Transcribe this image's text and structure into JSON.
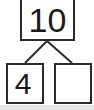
{
  "diagram": {
    "type": "number-bond",
    "line_color": "#2b2b2b",
    "border_color": "#2b2b2b",
    "text_color": "#1a1a1a",
    "background_color": "#ffffff",
    "strip_color": "#e9e9e9",
    "total": {
      "label": "10",
      "value": 10,
      "filled": true
    },
    "parts": [
      {
        "label": "4",
        "value": 4,
        "filled": true
      },
      {
        "label": "",
        "value": null,
        "filled": false
      }
    ],
    "connectors": [
      {
        "from": "total-bottom-center",
        "to": "part-left-top"
      },
      {
        "from": "total-bottom-center",
        "to": "part-right-top"
      }
    ]
  }
}
